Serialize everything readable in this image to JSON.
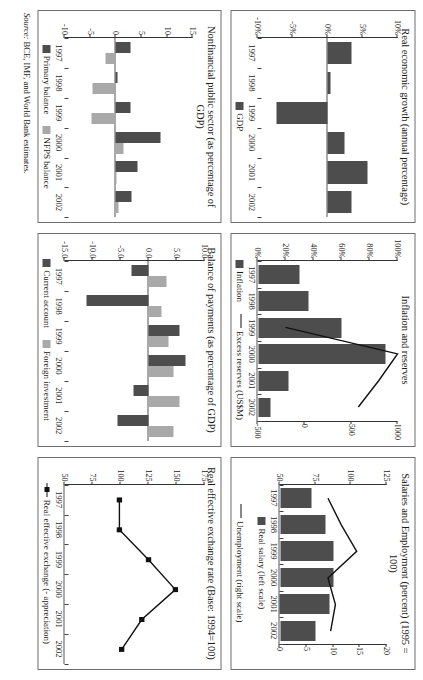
{
  "source": {
    "label": "Source:",
    "text": " BCE, IMF, and World Bank estimates."
  },
  "colors": {
    "dark_bar": "#4d4d4d",
    "light_bar": "#a9a9a9",
    "line": "#111111",
    "panel_border": "#6d6d6d",
    "axis": "#333333"
  },
  "charts": [
    {
      "id": "real-economic-growth",
      "title": "Real economic growth (annual percentage)",
      "chart_data": {
        "type": "bar",
        "title": "Real economic growth (annual percentage)",
        "categories": [
          "1997",
          "1998",
          "1999",
          "2000",
          "2001",
          "2002"
        ],
        "xlabel": "",
        "ylabel": "",
        "ylim": [
          -10,
          10
        ],
        "yticks": [
          10,
          5,
          0,
          -5,
          -10
        ],
        "ytick_labels": [
          "10%",
          "5%",
          "0%",
          "-5%",
          "-10%"
        ],
        "grid": false,
        "legend_position": "bottom",
        "series": [
          {
            "name": "GDP",
            "color": "#4d4d4d",
            "values": [
              3.4,
              0.4,
              -7.3,
              2.3,
              5.6,
              3.4
            ]
          }
        ]
      }
    },
    {
      "id": "inflation-and-reserves",
      "title": "Inflation and reserves",
      "chart_data": {
        "type": "bar",
        "title": "Inflation and reserves",
        "categories": [
          "1997",
          "1998",
          "1999",
          "2000",
          "2001",
          "2002"
        ],
        "xlabel": "",
        "ylabel": "",
        "ylim": [
          0,
          100
        ],
        "yticks": [
          0,
          20,
          40,
          60,
          80,
          100
        ],
        "ytick_labels": [
          "0%",
          "20%",
          "40%",
          "60%",
          "80%",
          "100%"
        ],
        "y2lim": [
          -500,
          1000
        ],
        "y2ticks": [
          -500,
          0,
          500,
          1000
        ],
        "y2tick_labels": [
          "-500",
          "0",
          "500",
          "1000"
        ],
        "grid": false,
        "legend_position": "bottom",
        "series": [
          {
            "name": "Inflation",
            "type": "bar",
            "axis": "left",
            "color": "#4d4d4d",
            "values": [
              30,
              36,
              60,
              91,
              22,
              9
            ]
          },
          {
            "name": "Excess reserves (US$M)",
            "type": "line",
            "axis": "right",
            "color": "#111111",
            "values": [
              null,
              null,
              -200,
              1000,
              800,
              580
            ]
          }
        ]
      }
    },
    {
      "id": "salaries-and-employment",
      "title": "Salaries and Employment (percent) (1995 = 100)",
      "chart_data": {
        "type": "bar",
        "title": "Salaries and Employment (percent) (1995 = 100)",
        "categories": [
          "1997",
          "1998",
          "1999",
          "2000",
          "2001",
          "2002"
        ],
        "xlabel": "",
        "ylabel": "",
        "ylim": [
          50,
          125
        ],
        "yticks": [
          50,
          75,
          100,
          125
        ],
        "ytick_labels": [
          "50",
          "75",
          "100",
          "125"
        ],
        "y2lim": [
          0,
          20
        ],
        "y2ticks": [
          0,
          5,
          10,
          15,
          20
        ],
        "y2tick_labels": [
          "0",
          "5",
          "10",
          "15",
          "20"
        ],
        "grid": false,
        "legend_position": "bottom",
        "series": [
          {
            "name": "Real salary (left scale)",
            "type": "bar",
            "axis": "left",
            "color": "#4d4d4d",
            "values": [
              72,
              82,
              88,
              88,
              85,
              75
            ]
          },
          {
            "name": "Unemployment (right scale)",
            "type": "line",
            "axis": "right",
            "color": "#111111",
            "values": [
              9.0,
              11.5,
              14.4,
              9.0,
              10.4,
              9.5
            ]
          }
        ]
      }
    },
    {
      "id": "nonfinancial-public-sector",
      "title": "Nonfinancial public sector (as percentage of GDP)",
      "chart_data": {
        "type": "bar",
        "title": "Nonfinancial public sector (as percentage of GDP)",
        "categories": [
          "1997",
          "1998",
          "1999",
          "2000",
          "2001",
          "2002"
        ],
        "xlabel": "",
        "ylabel": "",
        "ylim": [
          -10,
          15
        ],
        "yticks": [
          15,
          10,
          5,
          0,
          -5,
          -10
        ],
        "ytick_labels": [
          "15",
          "10",
          "5",
          "0",
          "-5",
          "-10"
        ],
        "grid": false,
        "legend_position": "bottom",
        "series": [
          {
            "name": "Primary balance",
            "color": "#4d4d4d",
            "values": [
              2.9,
              0.3,
              2.9,
              8.6,
              4.3,
              3.0
            ]
          },
          {
            "name": "NFPS balance",
            "color": "#a9a9a9",
            "values": [
              -2.0,
              -4.5,
              -4.7,
              1.4,
              0.1,
              0.6
            ]
          }
        ]
      }
    },
    {
      "id": "balance-of-payments",
      "title": "Balance of payments (as percentage of GDP)",
      "chart_data": {
        "type": "bar",
        "title": "Balance of payments (as percentage of GDP)",
        "categories": [
          "1997",
          "1998",
          "1999",
          "2000",
          "2001",
          "2002"
        ],
        "xlabel": "",
        "ylabel": "",
        "ylim": [
          -15,
          10
        ],
        "yticks": [
          10.0,
          5.0,
          0.0,
          -5.0,
          -10.0,
          -15.0
        ],
        "ytick_labels": [
          "10.0",
          "5.0",
          "0.0",
          "-5.0",
          "-10.0",
          "-15.0"
        ],
        "grid": false,
        "legend_position": "bottom",
        "series": [
          {
            "name": "Current account",
            "color": "#4d4d4d",
            "values": [
              -3.1,
              -11.0,
              5.5,
              6.7,
              -2.6,
              -5.6
            ]
          },
          {
            "name": "Foreign investment",
            "color": "#a9a9a9",
            "values": [
              3.2,
              2.3,
              3.6,
              4.5,
              5.6,
              4.4
            ]
          }
        ]
      }
    },
    {
      "id": "real-effective-exchange-rate",
      "title": "Real effective exchange rate (Base: 1994=100)",
      "chart_data": {
        "type": "line",
        "title": "Real effective exchange rate (Base: 1994=100)",
        "categories": [
          "1997",
          "1998",
          "1999",
          "2000",
          "2001",
          "2002"
        ],
        "xlabel": "",
        "ylabel": "",
        "ylim": [
          50,
          175
        ],
        "yticks": [
          175,
          150,
          125,
          100,
          75,
          50
        ],
        "ytick_labels": [
          "175",
          "150",
          "125",
          "100",
          "75",
          "50"
        ],
        "grid": false,
        "legend_position": "bottom",
        "series": [
          {
            "name": "Real effective exchange (- appreciation)",
            "type": "line",
            "marker": "square",
            "color": "#111111",
            "values": [
              99,
              99,
              125,
              149,
              119,
              101
            ]
          }
        ]
      }
    }
  ]
}
